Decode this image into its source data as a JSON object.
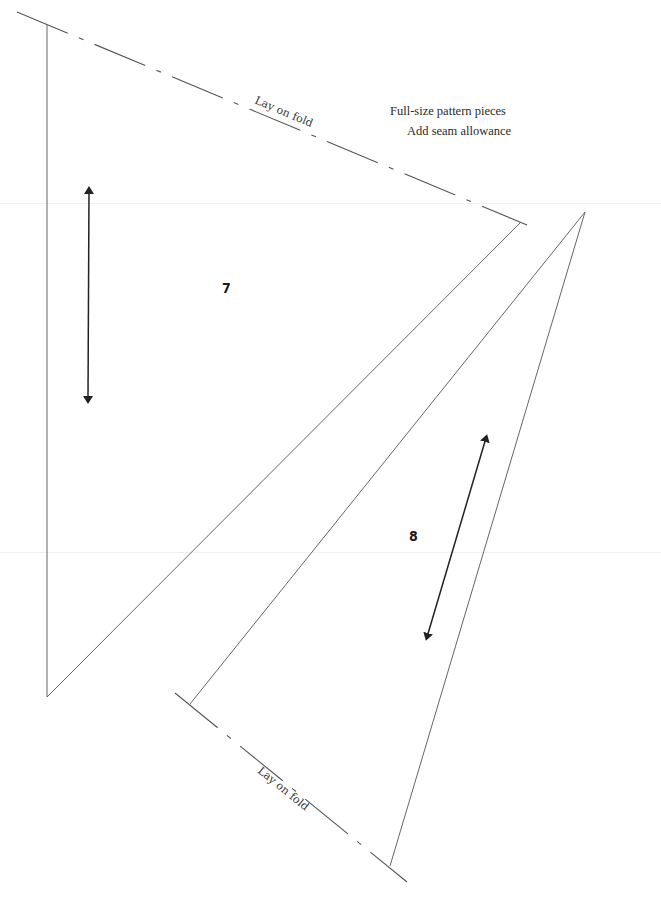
{
  "notes": {
    "line1": "Full-size pattern pieces",
    "line2": "Add seam allowance"
  },
  "pieces": [
    {
      "number": "7",
      "fold_label": "Lay on fold",
      "grainline": "vertical double-headed arrow"
    },
    {
      "number": "8",
      "fold_label": "Lay on fold",
      "grainline": "diagonal double-headed arrow"
    }
  ],
  "colors": {
    "line": "#555555",
    "arrow": "#222222",
    "text": "#2a2a2a",
    "background": "#ffffff"
  }
}
